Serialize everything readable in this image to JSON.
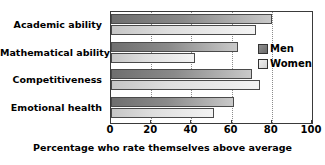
{
  "chart_data": {
    "type": "bar",
    "orientation": "horizontal",
    "title": "",
    "xlabel": "Percentage who rate themselves above average",
    "ylabel": "",
    "xlim": [
      0,
      100
    ],
    "xticks": [
      0,
      20,
      40,
      60,
      80,
      100
    ],
    "grid": true,
    "grid_axis": "x",
    "legend_position": "right-inside",
    "categories": [
      "Academic ability",
      "Mathematical ability",
      "Competitiveness",
      "Emotional health"
    ],
    "series": [
      {
        "name": "Men",
        "color": "#8a8a8a",
        "values": [
          80,
          63,
          70,
          61
        ]
      },
      {
        "name": "Women",
        "color": "#dedede",
        "values": [
          72,
          42,
          74,
          51
        ]
      }
    ]
  },
  "legend": {
    "items": [
      {
        "label": "Men",
        "swatch": "men"
      },
      {
        "label": "Women",
        "swatch": "women"
      }
    ]
  },
  "colors": {
    "men_bar": "#8a8a8a",
    "women_bar": "#dedede",
    "bar_outline": "#4a4a4a",
    "axis": "#3a3a3a",
    "gridline": "#8c8c8c",
    "text": "#000000",
    "background": "#ffffff"
  }
}
